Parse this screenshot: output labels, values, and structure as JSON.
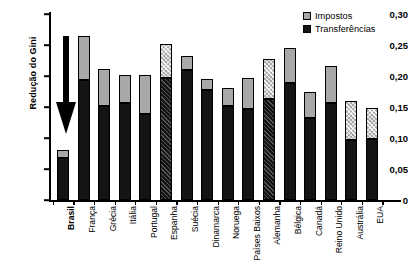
{
  "chart_data": {
    "type": "bar",
    "title": "",
    "subtitle": "",
    "xlabel": "",
    "ylabel": "Redução do Gini",
    "ylim": [
      0,
      0.3
    ],
    "ytick_labels": [
      "0",
      "0,05",
      "0,10",
      "0,15",
      "0,20",
      "0,25",
      "0,30"
    ],
    "ytick_values": [
      0,
      0.05,
      0.1,
      0.15,
      0.2,
      0.25,
      0.3
    ],
    "grid": false,
    "stacked": true,
    "legend_position": "top-right",
    "categories": [
      "Brasil",
      "França",
      "Grécia",
      "Itália",
      "Portugal",
      "Espanha",
      "Suécia",
      "Dinamarca",
      "Noruega",
      "Países Baixos",
      "Alemanha",
      "Bélgica",
      "Canadá",
      "Reino Unido",
      "Austrália",
      "EUA"
    ],
    "series": [
      {
        "name": "Transferências",
        "color": "#141414",
        "values": [
          0.068,
          0.194,
          0.152,
          0.157,
          0.138,
          0.196,
          0.209,
          0.178,
          0.152,
          0.147,
          0.163,
          0.189,
          0.132,
          0.156,
          0.097,
          0.099
        ]
      },
      {
        "name": "Impostos",
        "color": "#a8a8a8",
        "values": [
          0.012,
          0.071,
          0.06,
          0.044,
          0.063,
          0.056,
          0.023,
          0.017,
          0.028,
          0.049,
          0.064,
          0.056,
          0.043,
          0.06,
          0.062,
          0.049
        ]
      }
    ],
    "totals": [
      0.08,
      0.265,
      0.212,
      0.201,
      0.201,
      0.252,
      0.232,
      0.195,
      0.18,
      0.196,
      0.227,
      0.245,
      0.175,
      0.216,
      0.159,
      0.148
    ],
    "hatched_categories": [
      "Espanha",
      "Alemanha",
      "Austrália",
      "EUA"
    ],
    "annotations": [
      {
        "name": "down-arrow",
        "target_category": "Brasil",
        "text": ""
      }
    ]
  },
  "legend": {
    "items": [
      {
        "label": "Impostos",
        "swatch": "tax-swatch"
      },
      {
        "label": "Transferências",
        "swatch": "transfer-swatch"
      }
    ]
  },
  "axis": {
    "y_title": "Redução do Gini"
  }
}
